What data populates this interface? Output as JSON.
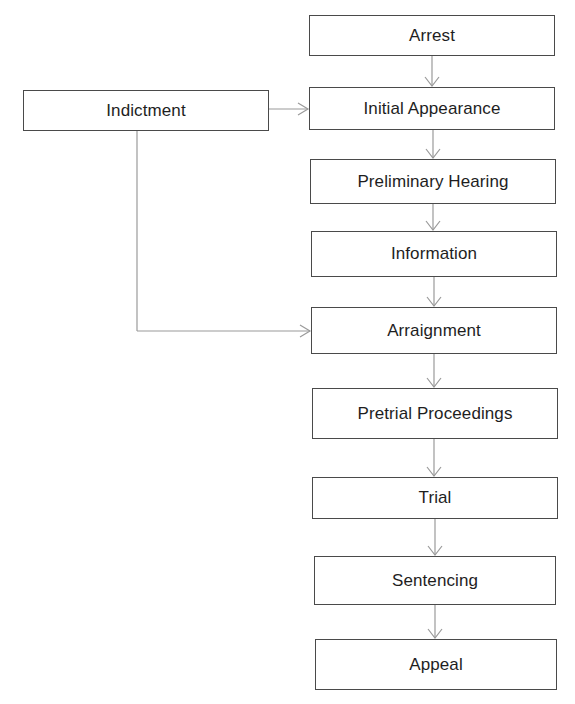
{
  "diagram": {
    "type": "flowchart",
    "direction": "top-to-bottom",
    "colors": {
      "box_border": "#4a4a4a",
      "connector": "#9a9a9a",
      "text": "#1e1e1e",
      "background": "#ffffff"
    },
    "nodes": [
      {
        "id": "arrest",
        "label": "Arrest"
      },
      {
        "id": "initial_appearance",
        "label": "Initial Appearance"
      },
      {
        "id": "preliminary_hearing",
        "label": "Preliminary Hearing"
      },
      {
        "id": "information",
        "label": "Information"
      },
      {
        "id": "arraignment",
        "label": "Arraignment"
      },
      {
        "id": "pretrial_proceedings",
        "label": "Pretrial Proceedings"
      },
      {
        "id": "trial",
        "label": "Trial"
      },
      {
        "id": "sentencing",
        "label": "Sentencing"
      },
      {
        "id": "appeal",
        "label": "Appeal"
      },
      {
        "id": "indictment",
        "label": "Indictment"
      }
    ],
    "edges": [
      {
        "from": "arrest",
        "to": "initial_appearance"
      },
      {
        "from": "initial_appearance",
        "to": "preliminary_hearing"
      },
      {
        "from": "preliminary_hearing",
        "to": "information"
      },
      {
        "from": "information",
        "to": "arraignment"
      },
      {
        "from": "arraignment",
        "to": "pretrial_proceedings"
      },
      {
        "from": "pretrial_proceedings",
        "to": "trial"
      },
      {
        "from": "trial",
        "to": "sentencing"
      },
      {
        "from": "sentencing",
        "to": "appeal"
      },
      {
        "from": "indictment",
        "to": "initial_appearance"
      },
      {
        "from": "indictment",
        "to": "arraignment"
      }
    ]
  }
}
